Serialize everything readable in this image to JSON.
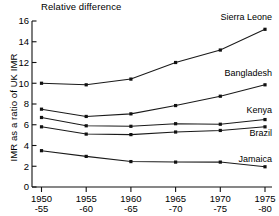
{
  "chart_data": {
    "type": "line",
    "title": "Relative difference",
    "xlabel": "",
    "ylabel": "IMR as a ratio of UK IMR",
    "categories": [
      "1950––55",
      "1955––60",
      "1960––65",
      "1965––70",
      "1970––75",
      "1975––80"
    ],
    "xtick_labels_top": [
      "1950",
      "1955",
      "1960",
      "1965",
      "1970",
      "1975"
    ],
    "xtick_labels_bottom": [
      "-55",
      "-60",
      "-65",
      "-70",
      "-75",
      "-80"
    ],
    "ytick_labels": [
      "0",
      "2",
      "4",
      "6",
      "8",
      "10",
      "12",
      "14",
      "16"
    ],
    "ylim": [
      0,
      16
    ],
    "grid": false,
    "legend_position": "inline-right",
    "series": [
      {
        "name": "Sierra Leone",
        "values": [
          10.0,
          9.85,
          10.4,
          12.0,
          13.2,
          15.2
        ]
      },
      {
        "name": "Bangladesh",
        "values": [
          7.5,
          6.8,
          7.05,
          7.85,
          8.75,
          9.85
        ]
      },
      {
        "name": "Kenya",
        "values": [
          6.7,
          5.9,
          5.85,
          6.1,
          6.05,
          6.5
        ]
      },
      {
        "name": "Brazil",
        "values": [
          5.8,
          5.1,
          5.05,
          5.3,
          5.45,
          5.8
        ]
      },
      {
        "name": "Jamaica",
        "values": [
          3.5,
          2.95,
          2.45,
          2.4,
          2.4,
          1.95
        ]
      }
    ]
  }
}
